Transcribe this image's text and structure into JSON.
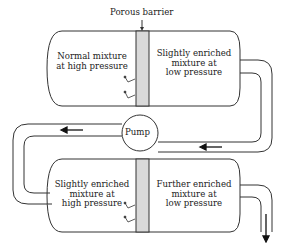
{
  "diagram": {
    "title_label": "Porous barrier",
    "pump_label": "Pump",
    "top_tank": {
      "left_line1": "Normal mixture",
      "left_line2": "at high pressure",
      "right_line1": "Slightly enriched",
      "right_line2": "mixture at",
      "right_line3": "low pressure"
    },
    "bottom_tank": {
      "left_line1": "Slightly enriched",
      "left_line2": "mixture at",
      "left_line3": "high pressure",
      "right_line1": "Further enriched",
      "right_line2": "mixture at",
      "right_line3": "low pressure"
    },
    "colors": {
      "line": "#333333",
      "barrier": "#d9d9d9"
    }
  }
}
